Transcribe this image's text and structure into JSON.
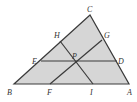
{
  "diagram": {
    "fill_color": "#d6d6d6",
    "stroke_color": "#3a3a3a",
    "points": {
      "A": {
        "label": "A",
        "x": 129,
        "y": 84
      },
      "B": {
        "label": "B",
        "x": 14,
        "y": 84
      },
      "C": {
        "label": "C",
        "x": 90,
        "y": 15
      },
      "D": {
        "label": "D",
        "x": 117,
        "y": 61
      },
      "E": {
        "label": "E",
        "x": 41,
        "y": 61
      },
      "F": {
        "label": "F",
        "x": 50,
        "y": 84
      },
      "G": {
        "label": "G",
        "x": 102,
        "y": 40
      },
      "H": {
        "label": "H",
        "x": 60,
        "y": 41
      },
      "I": {
        "label": "I",
        "x": 93,
        "y": 84
      },
      "P": {
        "label": "P",
        "x": 76,
        "y": 61
      }
    },
    "segments": [
      "ED",
      "FG",
      "HI"
    ],
    "labels": [
      {
        "text": "C",
        "x": 87,
        "y": 12
      },
      {
        "text": "H",
        "x": 54,
        "y": 38
      },
      {
        "text": "G",
        "x": 104,
        "y": 38
      },
      {
        "text": "E",
        "x": 32,
        "y": 64
      },
      {
        "text": "P",
        "x": 72,
        "y": 59
      },
      {
        "text": "D",
        "x": 118,
        "y": 64
      },
      {
        "text": "B",
        "x": 7,
        "y": 95
      },
      {
        "text": "F",
        "x": 47,
        "y": 95
      },
      {
        "text": "I",
        "x": 90,
        "y": 95
      },
      {
        "text": "A",
        "x": 127,
        "y": 95
      }
    ]
  }
}
